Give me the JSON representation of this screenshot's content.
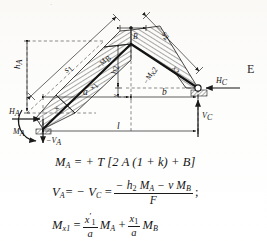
{
  "figure": {
    "nodes": {
      "a_label": "A",
      "b_label": "B",
      "c_label": "C"
    },
    "dimensions": [
      {
        "name": "span-left",
        "label": "a"
      },
      {
        "name": "span-right",
        "label": "b"
      },
      {
        "name": "total-span",
        "label": "l"
      },
      {
        "name": "height-a",
        "label": "h"
      },
      {
        "name": "height-a-sub",
        "label": "A"
      },
      {
        "name": "height-2",
        "label": "h"
      },
      {
        "name": "height-2-sub",
        "label": "2"
      },
      {
        "name": "rise-v",
        "label": "v"
      },
      {
        "name": "bar-length-1",
        "label": "s"
      },
      {
        "name": "bar-length-1-sub",
        "label": "1"
      },
      {
        "name": "bar-length-2",
        "label": "s"
      },
      {
        "name": "bar-length-2-sub",
        "label": "2"
      }
    ],
    "station_labels": [
      {
        "name": "station-x1",
        "label": "x"
      },
      {
        "name": "station-x1-sub",
        "label": "1"
      },
      {
        "name": "station-x2",
        "label": "x"
      },
      {
        "name": "station-x2-sub",
        "label": "2"
      }
    ],
    "moment_labels": [
      {
        "name": "moment-b",
        "label": "−M"
      },
      {
        "name": "moment-b-sub",
        "label": "B"
      },
      {
        "name": "moment-x2",
        "label": "−M"
      },
      {
        "name": "moment-x2-sub",
        "label": "x2"
      },
      {
        "name": "moment-positive-sign",
        "label": "+"
      }
    ],
    "reactions": [
      {
        "name": "reaction-ha",
        "label": "H",
        "sub": "A"
      },
      {
        "name": "reaction-ma",
        "label": "M",
        "sub": "A"
      },
      {
        "name": "reaction-va",
        "label": "−V",
        "sub": "A"
      },
      {
        "name": "reaction-hc",
        "label": "H",
        "sub": "C"
      },
      {
        "name": "reaction-vc",
        "label": "V",
        "sub": "C"
      }
    ]
  },
  "margin": {
    "right_letter": "E",
    "top_fragment": "·"
  },
  "formulas": {
    "eq1": {
      "lhs": "M",
      "lhs_sub": "A",
      "rhs": "= + T [2 A (1 + k) + B]"
    },
    "eq2": {
      "lhs": "V",
      "lhs_sub": "A",
      "mid": "= − V",
      "mid_sub": "C",
      "eq": "=",
      "numerator": "− h",
      "numerator_sub": "2",
      "numerator_rest": "M",
      "numerator_rest_sub": "A",
      "numerator_tail": "− v M",
      "numerator_tail_sub": "B",
      "denominator": "F",
      "terminator": ";"
    },
    "eq3": {
      "lhs": "M",
      "lhs_sub": "x1",
      "eq": "=",
      "frac1_num": "x",
      "frac1_num_sup": "′",
      "frac1_num_sub": "1",
      "frac1_den": "a",
      "term1": "M",
      "term1_sub": "A",
      "plus": "+",
      "frac2_num": "x",
      "frac2_num_sub": "1",
      "frac2_den": "a",
      "term2": "M",
      "term2_sub": "B"
    }
  },
  "colors": {
    "ink": "#161616",
    "paper": "#fcfcfb",
    "hatch": "#1b1b1b",
    "dashed": "#555555"
  }
}
